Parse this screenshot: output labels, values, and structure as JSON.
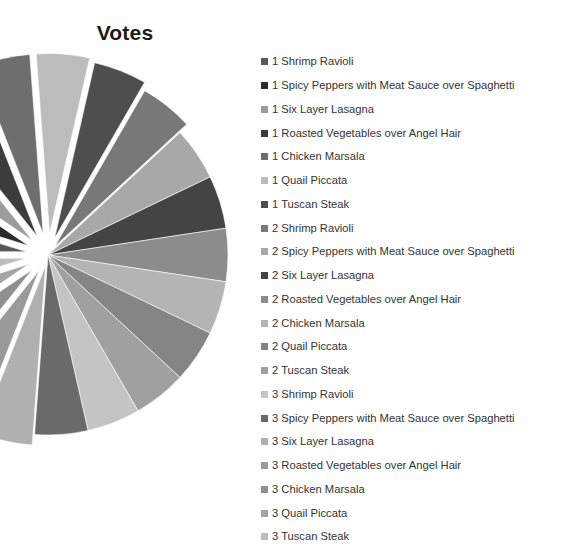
{
  "chart": {
    "title": "Votes"
  },
  "chart_data": {
    "type": "pie",
    "title": "Votes",
    "xlabel": "",
    "ylabel": "",
    "legend_position": "right",
    "grid": false,
    "exploded": true,
    "start_angle_deg": 180,
    "direction": "clockwise",
    "center": [
      48,
      255
    ],
    "radius": 180,
    "categories": [
      "1 Shrimp Ravioli",
      "1 Spicy Peppers with Meat Sauce over  Spaghetti",
      "1 Six Layer Lasagna",
      "1 Roasted Vegetables over Angel Hair",
      "1 Chicken  Marsala",
      "1 Quail Piccata",
      "1 Tuscan Steak",
      "2 Shrimp Ravioli",
      "2 Spicy Peppers with Meat Sauce over  Spaghetti",
      "2 Six Layer Lasagna",
      "2 Roasted Vegetables over Angel Hair",
      "2 Chicken  Marsala",
      "2 Quail Piccata",
      "2 Tuscan Steak",
      "3 Shrimp Ravioli",
      "3 Spicy Peppers with Meat Sauce over  Spaghetti",
      "3 Six Layer Lasagna",
      "3 Roasted Vegetables over Angel Hair",
      "3 Chicken  Marsala",
      "3 Quail Piccata",
      "3 Tuscan Steak"
    ],
    "values": [
      1,
      1,
      1,
      1,
      1,
      1,
      1,
      1,
      1,
      1,
      1,
      1,
      1,
      1,
      1,
      1,
      1,
      1,
      1,
      1,
      1
    ],
    "colors": [
      "#595959",
      "#2b2b2b",
      "#9c9c9c",
      "#3c3c3c",
      "#6e6e6e",
      "#bcbcbc",
      "#4e4e4e",
      "#787878",
      "#a8a8a8",
      "#444444",
      "#8c8c8c",
      "#b4b4b4",
      "#858585",
      "#a0a0a0",
      "#c4c4c4",
      "#6a6a6a",
      "#b0b0b0",
      "#9a9a9a",
      "#8f8f8f",
      "#a4a4a4",
      "#bdbdbd"
    ],
    "explode": [
      0.12,
      0.12,
      0.12,
      0.12,
      0.12,
      0.12,
      0.1,
      0.06,
      0.0,
      0.0,
      0.0,
      0.0,
      0.0,
      0.0,
      0.0,
      0.0,
      0.06,
      0.1,
      0.12,
      0.12,
      0.12
    ]
  },
  "legend": {
    "items": [
      {
        "label": "1 Shrimp Ravioli",
        "color": "#595959"
      },
      {
        "label": "1 Spicy Peppers with Meat Sauce over  Spaghetti",
        "color": "#2b2b2b"
      },
      {
        "label": "1 Six Layer Lasagna",
        "color": "#9c9c9c"
      },
      {
        "label": "1 Roasted Vegetables over Angel Hair",
        "color": "#3c3c3c"
      },
      {
        "label": "1 Chicken  Marsala",
        "color": "#6e6e6e"
      },
      {
        "label": "1 Quail Piccata",
        "color": "#bcbcbc"
      },
      {
        "label": "1 Tuscan Steak",
        "color": "#4e4e4e"
      },
      {
        "label": "2 Shrimp Ravioli",
        "color": "#787878"
      },
      {
        "label": "2 Spicy Peppers with Meat Sauce over  Spaghetti",
        "color": "#a8a8a8"
      },
      {
        "label": "2 Six Layer Lasagna",
        "color": "#444444"
      },
      {
        "label": "2 Roasted Vegetables over Angel Hair",
        "color": "#8c8c8c"
      },
      {
        "label": "2 Chicken  Marsala",
        "color": "#b4b4b4"
      },
      {
        "label": "2 Quail Piccata",
        "color": "#858585"
      },
      {
        "label": "2 Tuscan Steak",
        "color": "#a0a0a0"
      },
      {
        "label": "3 Shrimp Ravioli",
        "color": "#c4c4c4"
      },
      {
        "label": "3 Spicy Peppers with Meat Sauce over  Spaghetti",
        "color": "#6a6a6a"
      },
      {
        "label": "3 Six Layer Lasagna",
        "color": "#b0b0b0"
      },
      {
        "label": "3 Roasted Vegetables over Angel Hair",
        "color": "#9a9a9a"
      },
      {
        "label": "3 Chicken  Marsala",
        "color": "#8f8f8f"
      },
      {
        "label": "3 Quail Piccata",
        "color": "#a4a4a4"
      },
      {
        "label": "3 Tuscan Steak",
        "color": "#bdbdbd"
      }
    ]
  }
}
